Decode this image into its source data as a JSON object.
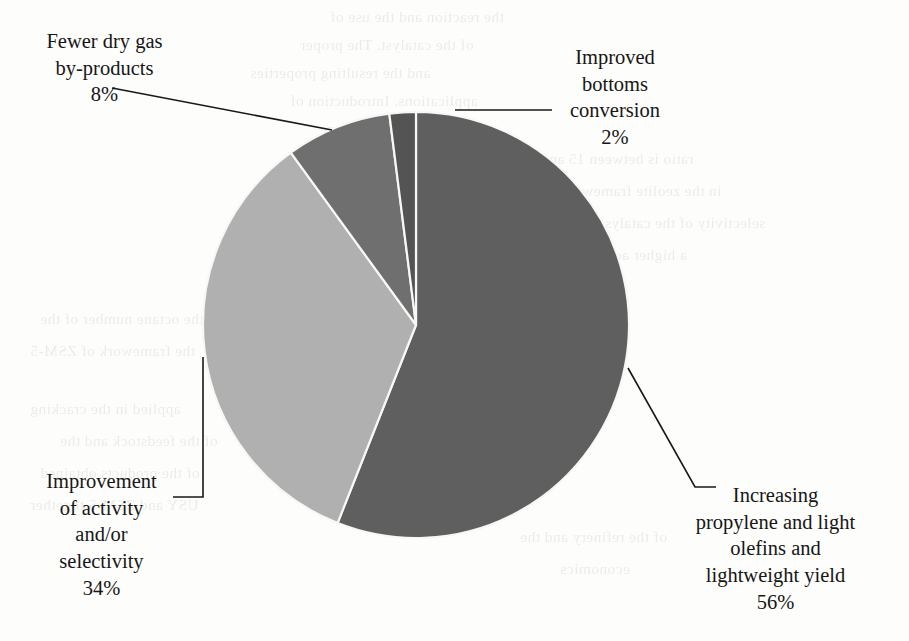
{
  "figure": {
    "background_color": "#fdfdfb",
    "ink_color": "#161616"
  },
  "chart_data": {
    "type": "pie",
    "title": "",
    "subtitle": "",
    "xlabel": "",
    "ylabel": "",
    "legend_position": "none",
    "grid": false,
    "label_format": "name + percent",
    "units": "percent",
    "total": 100,
    "start_angle_deg": 0,
    "direction": "clockwise",
    "categories": [
      "Increasing propylene and light olefins and lightweight yield",
      "Improvement of activity and/or selectivity",
      "Fewer dry gas by-products",
      "Improved bottoms conversion"
    ],
    "values": [
      56,
      34,
      8,
      2
    ],
    "value_labels": [
      "56%",
      "34%",
      "8%",
      "2%"
    ],
    "colors": [
      "#5f5f5f",
      "#b0b0b0",
      "#6f6f6f",
      "#545454"
    ],
    "slices": [
      {
        "name": "Increasing propylene and light olefins and lightweight yield",
        "value": 56,
        "value_label": "56%",
        "color": "#5f5f5f",
        "start_deg": 0,
        "end_deg": 201.6
      },
      {
        "name": "Improvement of activity and/or selectivity",
        "value": 34,
        "value_label": "34%",
        "color": "#b0b0b0",
        "start_deg": 201.6,
        "end_deg": 324.0
      },
      {
        "name": "Fewer dry gas by-products",
        "value": 8,
        "value_label": "8%",
        "color": "#6f6f6f",
        "start_deg": 324.0,
        "end_deg": 352.8
      },
      {
        "name": "Improved bottoms conversion",
        "value": 2,
        "value_label": "2%",
        "color": "#545454",
        "start_deg": 352.8,
        "end_deg": 360.0
      }
    ]
  },
  "labels": {
    "fewer_dry_gas": {
      "line1": "Fewer dry gas",
      "line2": "by-products",
      "percent": "8%"
    },
    "improved_bottoms": {
      "line1": "Improved",
      "line2": "bottoms",
      "line3": "conversion",
      "percent": "2%"
    },
    "improvement_activity": {
      "line1": "Improvement",
      "line2": "of activity",
      "line3": "and/or",
      "line4": "selectivity",
      "percent": "34%"
    },
    "increasing_propylene": {
      "line1": "Increasing",
      "line2": "propylene and light",
      "line3": "olefins and",
      "line4": "lightweight yield",
      "percent": "56%"
    }
  },
  "bleed_through": {
    "lines": [
      "the reaction and the use of",
      "of the catalyst. The proper",
      "and the resulting properties",
      "applications. Introduction of",
      "their size and the structure",
      "ratio is between 15 and 40",
      "in the zeolite framework",
      "selectivity of the catalyst",
      "a higher activity and a",
      "have been developed to",
      "the octane number of the",
      "the framework of ZSM-5",
      "applied in the cracking",
      "of the feedstock and the",
      "of the products obtained",
      "USY and ZSM-5 together",
      "of the refinery and the",
      "economics"
    ]
  }
}
